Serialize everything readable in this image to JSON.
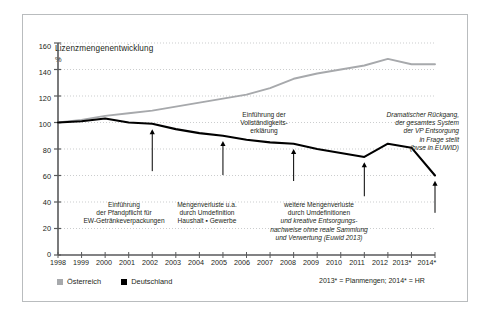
{
  "figure": {
    "title": "Lizenzmengenentwicklung",
    "unit_label": "%",
    "border_color": "#b9bcbe",
    "background": "#ffffff"
  },
  "legend": {
    "position": "bottom-left",
    "items": [
      {
        "label": "Österreich",
        "color": "#a7a9ac",
        "marker": "square"
      },
      {
        "label": "Deutschland",
        "color": "#000000",
        "marker": "square"
      }
    ]
  },
  "footnote": "2013* = Planmengen; 2014* = HR",
  "annotations": [
    {
      "id": "pfandpflicht",
      "lines": [
        "Einführung",
        "der Pfandpflicht für",
        "EW-Getränkeverpackungen"
      ],
      "italic_lines": [],
      "arrow_year": "2002",
      "arrow_label": "arrow-2002"
    },
    {
      "id": "mengenverluste-umdefinition",
      "lines": [
        "Mengenverluste u.a.",
        "durch Umdefinition",
        "Haushalt ▪ Gewerbe"
      ],
      "italic_lines": [],
      "arrow_year": "2005",
      "arrow_label": "arrow-2005"
    },
    {
      "id": "vollstaendigkeitserklaerung",
      "lines": [
        "Einführung der",
        "Vollständigkeits-",
        "erklärung"
      ],
      "italic_lines": [],
      "arrow_year": "2008",
      "arrow_label": "arrow-2008"
    },
    {
      "id": "weitere-mengenverluste",
      "lines": [
        "weitere Mengenverluste",
        "durch Umdefinitionen"
      ],
      "italic_lines": [
        "und kreative Entsorgungs-",
        "nachweise ohne reale Sammlung",
        "und Verwertung (Euwid 2013)"
      ],
      "arrow_year": "2011",
      "arrow_label": "arrow-2011"
    },
    {
      "id": "dramatischer-rueckgang",
      "lines": [],
      "italic_lines": [
        "Dramatischer Rückgang,",
        "der gesamtes System",
        "der VP Entsorgung",
        "in Frage stellt",
        "(bvse in EUWID)"
      ],
      "arrow_year": "2014*",
      "arrow_label": "arrow-2014"
    }
  ],
  "chart_data": {
    "type": "line",
    "title": "Lizenzmengenentwicklung",
    "xlabel": "",
    "ylabel": "%",
    "ylim": [
      0,
      160
    ],
    "ytick_step": 20,
    "yticks": [
      "0",
      "20",
      "40",
      "60",
      "80",
      "100",
      "120",
      "140",
      "160"
    ],
    "grid": true,
    "grid_style": "dotted-horizontal",
    "legend_position": "below-axis-left",
    "x": [
      "1998",
      "1999",
      "2000",
      "2001",
      "2002",
      "2003",
      "2004",
      "2005",
      "2006",
      "2007",
      "2008",
      "2009",
      "2010",
      "2011",
      "2012",
      "2013*",
      "2014*"
    ],
    "series": [
      {
        "name": "Österreich",
        "color": "#a7a9ac",
        "values": [
          100,
          102,
          105,
          107,
          109,
          112,
          115,
          118,
          121,
          126,
          133,
          137,
          140,
          143,
          148,
          144,
          144
        ]
      },
      {
        "name": "Deutschland",
        "color": "#000000",
        "values": [
          100,
          101,
          103,
          100,
          99,
          95,
          92,
          90,
          87,
          85,
          84,
          80,
          77,
          74,
          84,
          81,
          60
        ]
      }
    ]
  }
}
